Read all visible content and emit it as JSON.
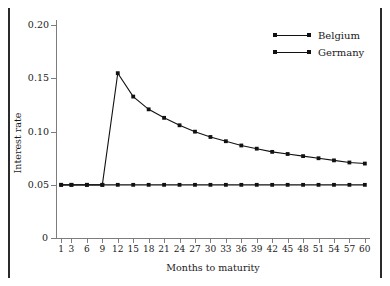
{
  "chart_data": {
    "type": "line",
    "title": "",
    "xlabel": "Months to maturity",
    "ylabel": "Interest rate",
    "xlim": [
      0,
      61
    ],
    "ylim": [
      0,
      0.205
    ],
    "grid": false,
    "legend_position": "top-right",
    "ytick_labels": [
      "0",
      "0.05",
      "0.10",
      "0.15",
      "0.20"
    ],
    "ytick_values": [
      0,
      0.05,
      0.1,
      0.15,
      0.2
    ],
    "xtick_labels": [
      "1",
      "3",
      "6",
      "9",
      "12",
      "15",
      "18",
      "21",
      "24",
      "27",
      "30",
      "33",
      "36",
      "39",
      "42",
      "45",
      "48",
      "51",
      "54",
      "57",
      "60"
    ],
    "xtick_values": [
      1,
      3,
      6,
      9,
      12,
      15,
      18,
      21,
      24,
      27,
      30,
      33,
      36,
      39,
      42,
      45,
      48,
      51,
      54,
      57,
      60
    ],
    "x": [
      1,
      3,
      6,
      9,
      12,
      15,
      18,
      21,
      24,
      27,
      30,
      33,
      36,
      39,
      42,
      45,
      48,
      51,
      54,
      57,
      60
    ],
    "series": [
      {
        "name": "Belgium",
        "color": "#111111",
        "marker": "square",
        "values": [
          0.05,
          0.05,
          0.05,
          0.05,
          0.155,
          0.133,
          0.121,
          0.113,
          0.106,
          0.1,
          0.095,
          0.091,
          0.087,
          0.084,
          0.081,
          0.079,
          0.077,
          0.075,
          0.073,
          0.071,
          0.07
        ]
      },
      {
        "name": "Germany",
        "color": "#111111",
        "marker": "square",
        "values": [
          0.05,
          0.05,
          0.05,
          0.05,
          0.05,
          0.05,
          0.05,
          0.05,
          0.05,
          0.05,
          0.05,
          0.05,
          0.05,
          0.05,
          0.05,
          0.05,
          0.05,
          0.05,
          0.05,
          0.05,
          0.05
        ]
      }
    ],
    "annotations": []
  },
  "legend": {
    "items": [
      {
        "label": "Belgium"
      },
      {
        "label": "Germany"
      }
    ]
  }
}
